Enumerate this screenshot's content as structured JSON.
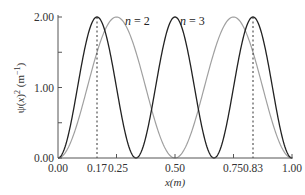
{
  "chart_data": {
    "type": "line",
    "title": "",
    "xlabel": "x(m)",
    "ylabel": "ψ(x)² (m⁻¹)",
    "xlim": [
      0.0,
      1.0
    ],
    "ylim": [
      0.0,
      2.0
    ],
    "grid": false,
    "legend": "inline annotations",
    "x_ticks": [
      0.0,
      0.17,
      0.25,
      0.5,
      0.75,
      0.83,
      1.0
    ],
    "x_tick_labels": [
      "0.00",
      "0.17",
      "0.25",
      "0.50",
      "0.75",
      "0.83",
      "1.00"
    ],
    "y_ticks": [
      0.0,
      0.5,
      1.0,
      1.5,
      2.0
    ],
    "y_tick_labels": [
      "0.00",
      "",
      "1.00",
      "",
      "2.00"
    ],
    "series": [
      {
        "name": "n = 2",
        "color": "#a0a0a0",
        "formula": "2 sin^2(2πx)",
        "x": [
          0.0,
          0.125,
          0.25,
          0.375,
          0.5,
          0.625,
          0.75,
          0.875,
          1.0
        ],
        "values": [
          0.0,
          1.0,
          2.0,
          1.0,
          0.0,
          1.0,
          2.0,
          1.0,
          0.0
        ]
      },
      {
        "name": "n = 3",
        "color": "#222222",
        "formula": "2 sin^2(3πx)",
        "x": [
          0.0,
          0.0833,
          0.1667,
          0.25,
          0.3333,
          0.4167,
          0.5,
          0.5833,
          0.6667,
          0.75,
          0.8333,
          0.9167,
          1.0
        ],
        "values": [
          0.0,
          1.0,
          2.0,
          1.0,
          0.0,
          1.0,
          2.0,
          1.0,
          0.0,
          1.0,
          2.0,
          1.0,
          0.0
        ]
      }
    ],
    "annotations": [
      {
        "text": "n = 2",
        "x": 0.38,
        "y": 1.9
      },
      {
        "text": "n = 3",
        "x": 0.61,
        "y": 1.9
      },
      {
        "type": "dashed-vline",
        "x": 0.17
      },
      {
        "type": "dashed-vline",
        "x": 0.83
      }
    ]
  },
  "labels": {
    "n2": "n = 2",
    "n3": "n = 3",
    "xlabel": "x(m)",
    "y0": "0.00",
    "y1": "1.00",
    "y2": "2.00",
    "x0": "0.00",
    "x017": "0.17",
    "x025": "0.25",
    "x050": "0.50",
    "x075": "0.75",
    "x083": "0.83",
    "x100": "1.00"
  }
}
